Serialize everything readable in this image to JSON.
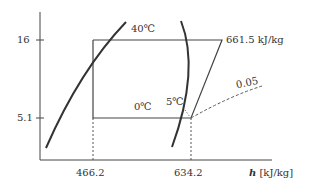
{
  "diagram": {
    "type": "P-h diagram (refrigeration cycle)",
    "y_ticks": [
      {
        "label": "16"
      },
      {
        "label": "5.1"
      }
    ],
    "x_ticks": [
      {
        "label": "466.2"
      },
      {
        "label": "634.2"
      }
    ],
    "x_axis": {
      "symbol": "h",
      "unit": "[kJ/kg]"
    },
    "labels": {
      "temp_high": "40℃",
      "temp_evap": "0℃",
      "temp_superheat": "5℃",
      "enthalpy_discharge": "661.5 kJ/kg",
      "specific_volume": "0.05"
    },
    "colors": {
      "line": "#333333",
      "background": "#ffffff"
    }
  }
}
